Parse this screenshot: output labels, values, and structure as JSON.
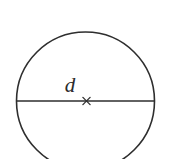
{
  "figure": {
    "name": "circle-with-diameter",
    "background_color": "#ffffff",
    "stroke_color": "#2e2e2e",
    "canvas": {
      "width": 170,
      "height": 159
    },
    "circle": {
      "center_x": 85.5,
      "center_y": 101,
      "radius": 69,
      "stroke_width": 1.6,
      "fill": "none",
      "cropped_at_bottom": true
    },
    "diameter_line": {
      "x1": 16,
      "y1": 101,
      "x2": 154.5,
      "y2": 101,
      "stroke_width": 1.4
    },
    "center_mark": {
      "glyph": "x",
      "x": 86.5,
      "y": 101,
      "arm_length": 3.6,
      "stroke_width": 1.3
    },
    "labels": [
      {
        "id": "diameter-label",
        "text": "d",
        "x": 70,
        "y": 92,
        "font_size": 21,
        "style": "italic-serif",
        "color": "#2b2b2b"
      }
    ]
  }
}
